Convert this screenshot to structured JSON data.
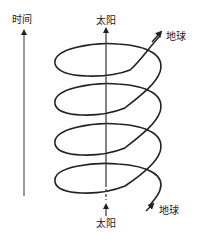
{
  "diagram": {
    "time_axis": {
      "label": "时间",
      "direction": "up"
    },
    "sun": {
      "top_label": "太阳",
      "bottom_label": "太阳"
    },
    "earth": {
      "top_label": "地球",
      "bottom_label": "地球"
    },
    "helix": {
      "turns": 4,
      "stroke_color": "#222222"
    }
  }
}
